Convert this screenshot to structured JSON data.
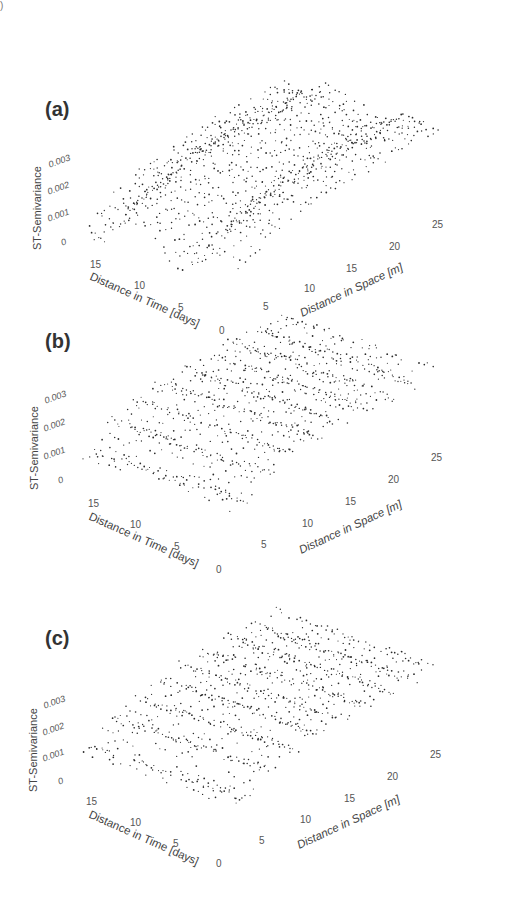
{
  "corner_mark": ")",
  "panels": [
    {
      "label": "(a)",
      "offset": 0,
      "style": "wavy"
    },
    {
      "label": "(b)",
      "offset": 292,
      "style": "ridged"
    },
    {
      "label": "(c)",
      "offset": 280,
      "style": "ridged"
    }
  ],
  "axes": {
    "z_label": "ST-Semivariance",
    "z_ticks": [
      "0.003",
      "0.002",
      "0.001",
      "0"
    ],
    "time_label": "Distance in Time [days]",
    "time_ticks": [
      "15",
      "10",
      "5",
      "0"
    ],
    "space_label": "Distance in Space [m]",
    "space_ticks": [
      "5",
      "10",
      "15",
      "20",
      "25"
    ]
  },
  "chart_data": [
    {
      "type": "scatter",
      "title": "(a)",
      "projection": "3d",
      "xlabel": "Distance in Time [days]",
      "ylabel": "Distance in Space [m]",
      "zlabel": "ST-Semivariance",
      "x_range": [
        0,
        17
      ],
      "y_range": [
        0,
        28
      ],
      "z_range": [
        0,
        0.003
      ],
      "x_ticks": [
        0,
        5,
        10,
        15
      ],
      "y_ticks": [
        5,
        10,
        15,
        20,
        25
      ],
      "z_ticks": [
        0,
        0.001,
        0.002,
        0.003
      ],
      "description": "Empirical spatio-temporal semivariogram point cloud; semivariance rises from ~0 near origin to ~0.002-0.003 at larger lags, with wavy temporal structure"
    },
    {
      "type": "scatter",
      "title": "(b)",
      "projection": "3d",
      "xlabel": "Distance in Time [days]",
      "ylabel": "Distance in Space [m]",
      "zlabel": "ST-Semivariance",
      "x_range": [
        0,
        17
      ],
      "y_range": [
        0,
        28
      ],
      "z_range": [
        0,
        0.003
      ],
      "x_ticks": [
        0,
        5,
        10,
        15
      ],
      "y_ticks": [
        5,
        10,
        15,
        20,
        25
      ],
      "z_ticks": [
        0,
        0.001,
        0.002,
        0.003
      ],
      "description": "Semivariogram point cloud arranged in distinct ridges along space axis; values ~0.001-0.003"
    },
    {
      "type": "scatter",
      "title": "(c)",
      "projection": "3d",
      "xlabel": "Distance in Time [days]",
      "ylabel": "Distance in Space [m]",
      "zlabel": "ST-Semivariance",
      "x_range": [
        0,
        17
      ],
      "y_range": [
        0,
        28
      ],
      "z_range": [
        0,
        0.003
      ],
      "x_ticks": [
        0,
        5,
        10,
        15
      ],
      "y_ticks": [
        5,
        10,
        15,
        20,
        25
      ],
      "z_ticks": [
        0,
        0.001,
        0.002,
        0.003
      ],
      "description": "Semivariogram point cloud arranged in ridges along space axis; similar to (b)"
    }
  ]
}
